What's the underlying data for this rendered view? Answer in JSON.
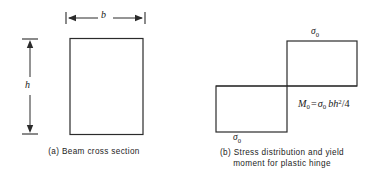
{
  "figure": {
    "background_color": "#ffffff",
    "line_color": "#2b2b2b",
    "panels": [
      {
        "id": "a",
        "caption": "(a) Beam cross section",
        "shape": "rectangle",
        "dimension_labels": {
          "width": "b",
          "height": "h"
        }
      },
      {
        "id": "b",
        "caption_line1": "(b) Stress distribution and yield",
        "caption_line2": "moment for plastic hinge",
        "shape": "two-offset-rectangles-step",
        "stress_label_top": "σ",
        "stress_label_top_sub": "0",
        "stress_label_bottom": "σ",
        "stress_label_bottom_sub": "0",
        "formula": {
          "lhs": "M",
          "lhs_sub": "0",
          "equals": "=",
          "sigma": "σ",
          "sigma_sub": "0",
          "term_b": "b",
          "term_h": "h",
          "exponent": "2",
          "divider": "/",
          "denominator": "4",
          "plain_text": "M0 = σ0 bh2/4"
        }
      }
    ]
  }
}
